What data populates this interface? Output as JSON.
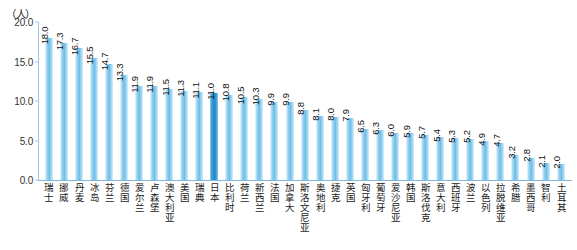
{
  "chart_data": {
    "type": "bar",
    "title": "",
    "subtitle": "",
    "unit_label": "（人）",
    "xlabel": "",
    "ylabel": "",
    "ylim": [
      0.0,
      20.0
    ],
    "y_ticks": [
      "0.0",
      "5.0",
      "10.0",
      "15.0",
      "20.0"
    ],
    "y_tick_values": [
      0.0,
      5.0,
      10.0,
      15.0,
      20.0
    ],
    "grid": false,
    "legend": "none",
    "highlight_category": "日本",
    "highlight_color": "#1f87c7",
    "bar_color": "#6fbfe8",
    "axis_color": "#7fb8dc",
    "categories": [
      "瑞士",
      "挪威",
      "丹麦",
      "冰岛",
      "芬兰",
      "德国",
      "爱尔兰",
      "卢森堡",
      "澳大利亚",
      "美国",
      "瑞典",
      "日本",
      "比利时",
      "荷兰",
      "新西兰",
      "法国",
      "加拿大",
      "斯洛文尼亚",
      "奥地利",
      "捷克",
      "英国",
      "匈牙利",
      "葡萄牙",
      "爱沙尼亚",
      "韩国",
      "斯洛伐克",
      "意大利",
      "西班牙",
      "波兰",
      "以色列",
      "拉脱维亚",
      "希腊",
      "墨西哥",
      "智利",
      "土耳其"
    ],
    "values": [
      18.0,
      17.3,
      16.7,
      15.5,
      14.7,
      13.3,
      11.9,
      11.9,
      11.5,
      11.3,
      11.1,
      11.0,
      10.8,
      10.5,
      10.3,
      9.9,
      9.9,
      8.8,
      8.1,
      8.0,
      7.9,
      6.5,
      6.3,
      6.0,
      5.9,
      5.7,
      5.4,
      5.3,
      5.2,
      4.9,
      4.7,
      3.2,
      2.8,
      2.1,
      2.0
    ],
    "value_labels": [
      "18.0",
      "17.3",
      "16.7",
      "15.5",
      "14.7",
      "13.3",
      "11.9",
      "11.9",
      "11.5",
      "11.3",
      "11.1",
      "11.0",
      "10.8",
      "10.5",
      "10.3",
      "9.9",
      "9.9",
      "8.8",
      "8.1",
      "8.0",
      "7.9",
      "6.5",
      "6.3",
      "6.0",
      "5.9",
      "5.7",
      "5.4",
      "5.3",
      "5.2",
      "4.9",
      "4.7",
      "3.2",
      "2.8",
      "2.1",
      "2.0"
    ]
  }
}
